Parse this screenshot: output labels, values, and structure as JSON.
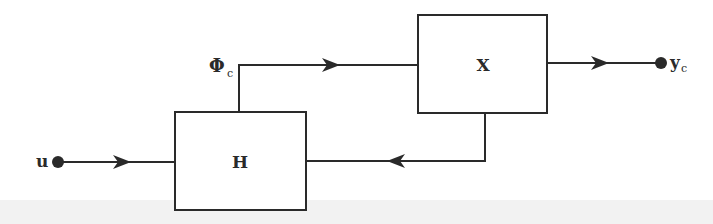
{
  "diagram": {
    "type": "block-diagram",
    "colors": {
      "stroke": "#2a2a2a",
      "background": "#ffffff"
    },
    "blocks": [
      {
        "id": "H",
        "label": "H"
      },
      {
        "id": "X",
        "label": "X"
      }
    ],
    "signals": {
      "input": {
        "label": "u"
      },
      "intermediate": {
        "label": "Φ",
        "subscript": "c"
      },
      "output": {
        "label": "y",
        "subscript": "c"
      }
    },
    "connections": [
      {
        "from": "u",
        "to": "H",
        "direction": "right"
      },
      {
        "from": "H",
        "to": "X",
        "signal": "Φc",
        "direction": "right"
      },
      {
        "from": "X",
        "to": "yc",
        "direction": "right"
      },
      {
        "from": "X",
        "to": "H",
        "direction": "left",
        "kind": "feedback"
      }
    ]
  }
}
